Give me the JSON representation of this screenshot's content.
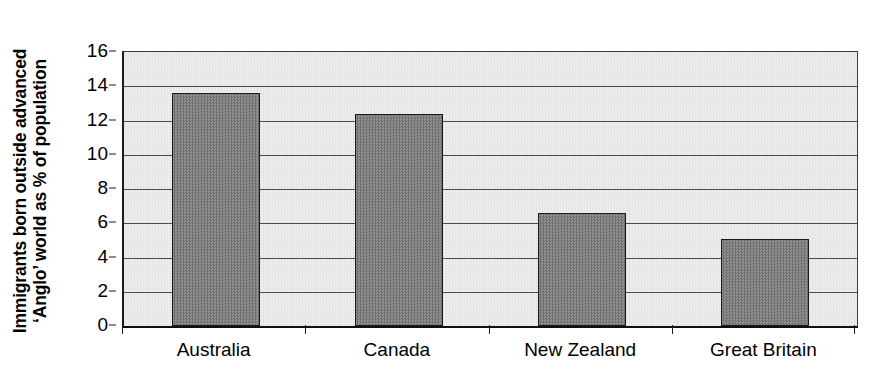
{
  "chart_data": {
    "type": "bar",
    "title": "",
    "subtitle": "",
    "xlabel": "",
    "ylabel_lines": [
      "Immigrants born outside advanced",
      "‘Anglo’ world as % of population"
    ],
    "ylabel": "Immigrants born outside advanced ‘Anglo’ world as % of population",
    "categories": [
      "Australia",
      "Canada",
      "New Zealand",
      "Great Britain"
    ],
    "values": [
      13.6,
      12.4,
      6.6,
      5.1
    ],
    "series": [
      {
        "name": "Immigrants born outside advanced 'Anglo' world as % of population",
        "values": [
          13.6,
          12.4,
          6.6,
          5.1
        ]
      }
    ],
    "ylim": [
      0,
      16
    ],
    "ytick_values": [
      0,
      2,
      4,
      6,
      8,
      10,
      12,
      14,
      16
    ],
    "ytick_labels": [
      "0",
      "2",
      "4",
      "6",
      "8",
      "10",
      "12",
      "14",
      "16"
    ],
    "grid": true,
    "grid_axis": "y",
    "legend": false,
    "legend_position": "none",
    "annotations": [],
    "colors": {
      "bar_fill": "#818181",
      "bar_border": "#1a1a1a",
      "plot_background": "#e9e9e9",
      "gridline": "#4b4b4b",
      "axis": "#101010",
      "text": "#000000",
      "figure_background": "#ffffff"
    }
  }
}
